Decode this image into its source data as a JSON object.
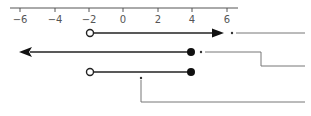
{
  "diagram": {
    "type": "number-line-inequalities",
    "axis": {
      "min": -6,
      "max": 6,
      "ticks": [
        {
          "value": -6,
          "label": "−6"
        },
        {
          "value": -4,
          "label": "−4"
        },
        {
          "value": -2,
          "label": "−2"
        },
        {
          "value": 0,
          "label": "0"
        },
        {
          "value": 2,
          "label": "2"
        },
        {
          "value": 4,
          "label": "4"
        },
        {
          "value": 6,
          "label": "6"
        }
      ]
    },
    "rows": [
      {
        "name": "row-1",
        "description": "x > -2",
        "start": {
          "value": -2,
          "endpoint": "open"
        },
        "end": {
          "value": 6,
          "endpoint": "arrow-right"
        }
      },
      {
        "name": "row-2",
        "description": "x ≤ 4",
        "start": {
          "value": -6,
          "endpoint": "arrow-left"
        },
        "end": {
          "value": 4,
          "endpoint": "closed"
        }
      },
      {
        "name": "row-3",
        "description": "-2 < x ≤ 4",
        "start": {
          "value": -2,
          "endpoint": "open"
        },
        "end": {
          "value": 4,
          "endpoint": "closed"
        }
      }
    ],
    "colors": {
      "axis": "#555555",
      "line": "#222222",
      "connector": "#666666",
      "tick_label": "#555555"
    }
  }
}
